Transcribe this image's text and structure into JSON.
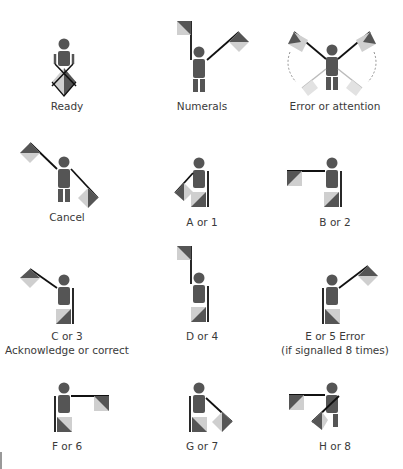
{
  "colors": {
    "body": "#555555",
    "flag_dark": "#555555",
    "flag_light": "#cfcfcf",
    "pole": "#111111",
    "text": "#3a3a3a"
  },
  "signals": [
    {
      "id": "ready",
      "label": "Ready"
    },
    {
      "id": "numerals",
      "label": "Numerals"
    },
    {
      "id": "error-attention",
      "label": "Error or attention"
    },
    {
      "id": "cancel",
      "label": "Cancel"
    },
    {
      "id": "a-1",
      "label": "A or 1"
    },
    {
      "id": "b-2",
      "label": "B or 2"
    },
    {
      "id": "c-3",
      "label": "C or 3",
      "sublabel": "Acknowledge or correct"
    },
    {
      "id": "d-4",
      "label": "D or 4"
    },
    {
      "id": "e-5",
      "label": "E or 5 Error",
      "sublabel": "(if signalled 8 times)"
    },
    {
      "id": "f-6",
      "label": "F or 6"
    },
    {
      "id": "g-7",
      "label": "G or 7"
    },
    {
      "id": "h-8",
      "label": "H or 8"
    }
  ]
}
